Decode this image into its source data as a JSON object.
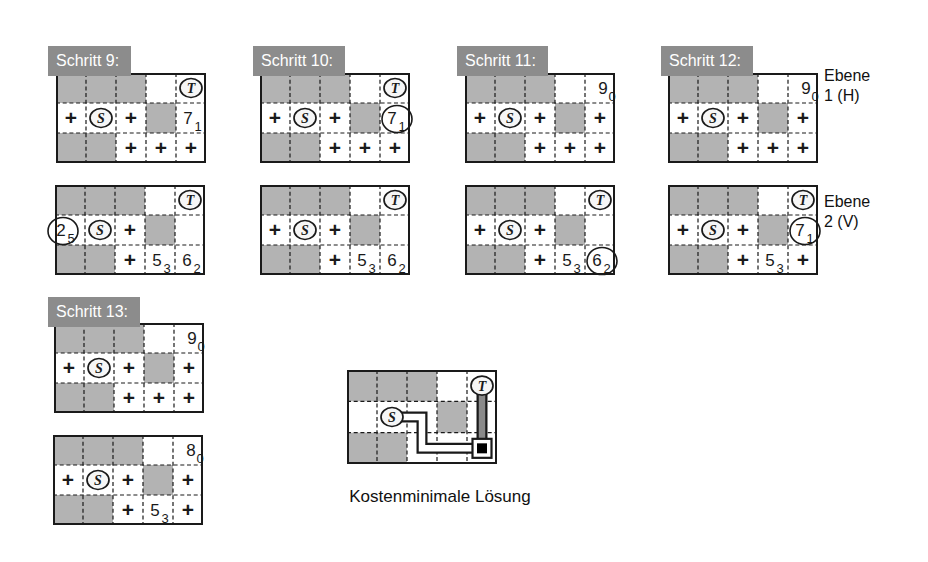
{
  "colors": {
    "page_bg": "#ffffff",
    "cell_gray": "#b3b3b3",
    "label_bg": "#8c8c8c",
    "label_text": "#ffffff",
    "line_color": "#1a1a1a",
    "node_fill": "#f6f6f6",
    "h_route_fill": "#ffffff",
    "v_route_fill": "#8a8a8a",
    "via_color": "#000000"
  },
  "levels": [
    {
      "line1": "Ebene",
      "line2": "1 (H)"
    },
    {
      "line1": "Ebene",
      "line2": "2 (V)"
    }
  ],
  "steps": [
    {
      "label": "Schritt 9:",
      "h": [
        [
          "G",
          "G",
          "G",
          "",
          "T"
        ],
        [
          "+",
          "S",
          "+",
          "G",
          {
            "n": "7",
            "s": "1"
          }
        ],
        [
          "G",
          "G",
          "+",
          "+",
          "+"
        ]
      ],
      "v": [
        [
          "G",
          "G",
          "G",
          "",
          "T"
        ],
        [
          {
            "n": "2",
            "s": "5",
            "c": true
          },
          "S",
          "+",
          "G",
          ""
        ],
        [
          "G",
          "G",
          "+",
          {
            "n": "5",
            "s": "3"
          },
          {
            "n": "6",
            "s": "2"
          }
        ]
      ]
    },
    {
      "label": "Schritt 10:",
      "h": [
        [
          "G",
          "G",
          "G",
          "",
          "T"
        ],
        [
          "+",
          "S",
          "+",
          "G",
          {
            "n": "7",
            "s": "1",
            "c": true
          }
        ],
        [
          "G",
          "G",
          "+",
          "+",
          "+"
        ]
      ],
      "v": [
        [
          "G",
          "G",
          "G",
          "",
          "T"
        ],
        [
          "+",
          "S",
          "+",
          "G",
          ""
        ],
        [
          "G",
          "G",
          "+",
          {
            "n": "5",
            "s": "3"
          },
          {
            "n": "6",
            "s": "2"
          }
        ]
      ]
    },
    {
      "label": "Schritt 11:",
      "h": [
        [
          "G",
          "G",
          "G",
          "",
          {
            "n": "9",
            "s": "0"
          }
        ],
        [
          "+",
          "S",
          "+",
          "G",
          "+"
        ],
        [
          "G",
          "G",
          "+",
          "+",
          "+"
        ]
      ],
      "v": [
        [
          "G",
          "G",
          "G",
          "",
          "T"
        ],
        [
          "+",
          "S",
          "+",
          "G",
          ""
        ],
        [
          "G",
          "G",
          "+",
          {
            "n": "5",
            "s": "3"
          },
          {
            "n": "6",
            "s": "2",
            "c": true
          }
        ]
      ]
    },
    {
      "label": "Schritt 12:",
      "h": [
        [
          "G",
          "G",
          "G",
          "",
          {
            "n": "9",
            "s": "0"
          }
        ],
        [
          "+",
          "S",
          "+",
          "G",
          "+"
        ],
        [
          "G",
          "G",
          "+",
          "+",
          "+"
        ]
      ],
      "v": [
        [
          "G",
          "G",
          "G",
          "",
          "T"
        ],
        [
          "+",
          "S",
          "+",
          "G",
          {
            "n": "7",
            "s": "1",
            "c": true
          }
        ],
        [
          "G",
          "G",
          "+",
          {
            "n": "5",
            "s": "3"
          },
          "+"
        ]
      ]
    },
    {
      "label": "Schritt 13:",
      "h": [
        [
          "G",
          "G",
          "G",
          "",
          {
            "n": "9",
            "s": "0"
          }
        ],
        [
          "+",
          "S",
          "+",
          "G",
          "+"
        ],
        [
          "G",
          "G",
          "+",
          "+",
          "+"
        ]
      ],
      "v": [
        [
          "G",
          "G",
          "G",
          "",
          {
            "n": "8",
            "s": "0"
          }
        ],
        [
          "+",
          "S",
          "+",
          "G",
          "+"
        ],
        [
          "G",
          "G",
          "+",
          {
            "n": "5",
            "s": "3"
          },
          "+"
        ]
      ]
    }
  ],
  "solution": {
    "caption": "Kostenminimale Lösung",
    "cells": [
      [
        "G",
        "G",
        "G",
        "",
        "T"
      ],
      [
        "",
        "S",
        "",
        "G",
        ""
      ],
      [
        "G",
        "G",
        "",
        "",
        ""
      ]
    ],
    "route": {
      "layer1_cells": [
        [
          1,
          1
        ],
        [
          1,
          2
        ],
        [
          2,
          2
        ],
        [
          2,
          3
        ],
        [
          2,
          4
        ]
      ],
      "layer2_cells": [
        [
          2,
          4
        ],
        [
          1,
          4
        ],
        [
          0,
          4
        ]
      ],
      "via_cell": [
        2,
        4
      ]
    }
  }
}
